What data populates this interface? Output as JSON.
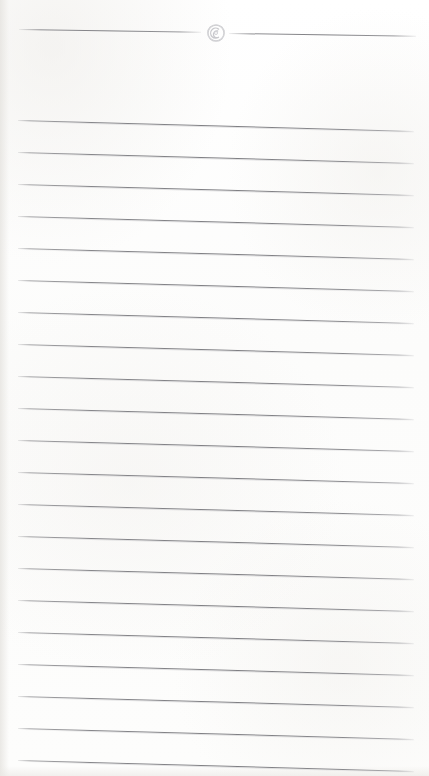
{
  "document": {
    "kind": "lined-note-page",
    "title": "Lined Note Page",
    "page_width": 429,
    "page_height": 776,
    "background_color": "#fdfdfc",
    "rule_color": "#808084",
    "ornament_color": "#c8c8cb"
  },
  "header": {
    "divider": {
      "name": "decorative-divider",
      "left_rule": {
        "x": 19,
        "y": 29,
        "width": 182
      },
      "right_rule": {
        "x": 229,
        "y": 33,
        "width": 187
      },
      "ornament": {
        "icon": "spiral-circle-icon",
        "center_x": 216,
        "center_y": 33,
        "diameter": 18
      }
    }
  },
  "body": {
    "name": "ruled-writing-area",
    "line_count": 21,
    "first_line_y": 120,
    "line_spacing": 32,
    "line_left_x": 18,
    "line_width": 396,
    "slant_degrees": 1.58,
    "lines": [
      {
        "index": 1,
        "y": 120,
        "text": ""
      },
      {
        "index": 2,
        "y": 152,
        "text": ""
      },
      {
        "index": 3,
        "y": 184,
        "text": ""
      },
      {
        "index": 4,
        "y": 216,
        "text": ""
      },
      {
        "index": 5,
        "y": 248,
        "text": ""
      },
      {
        "index": 6,
        "y": 280,
        "text": ""
      },
      {
        "index": 7,
        "y": 312,
        "text": ""
      },
      {
        "index": 8,
        "y": 344,
        "text": ""
      },
      {
        "index": 9,
        "y": 376,
        "text": ""
      },
      {
        "index": 10,
        "y": 408,
        "text": ""
      },
      {
        "index": 11,
        "y": 440,
        "text": ""
      },
      {
        "index": 12,
        "y": 472,
        "text": ""
      },
      {
        "index": 13,
        "y": 504,
        "text": ""
      },
      {
        "index": 14,
        "y": 536,
        "text": ""
      },
      {
        "index": 15,
        "y": 568,
        "text": ""
      },
      {
        "index": 16,
        "y": 600,
        "text": ""
      },
      {
        "index": 17,
        "y": 632,
        "text": ""
      },
      {
        "index": 18,
        "y": 664,
        "text": ""
      },
      {
        "index": 19,
        "y": 696,
        "text": ""
      },
      {
        "index": 20,
        "y": 728,
        "text": ""
      },
      {
        "index": 21,
        "y": 760,
        "text": ""
      }
    ]
  }
}
